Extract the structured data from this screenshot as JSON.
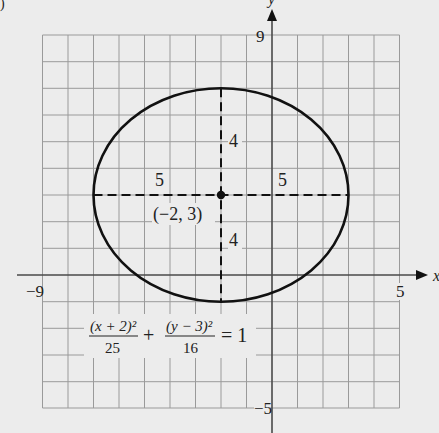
{
  "figure": {
    "corner_fragment": ")",
    "axes": {
      "x_label": "x",
      "y_label": "y",
      "x_min_label": "−9",
      "x_max_label": "5",
      "y_max_label": "9",
      "y_min_label": "−5",
      "x_range": [
        -9,
        5
      ],
      "y_range": [
        -5,
        9
      ]
    },
    "ellipse": {
      "center_label": "(−2, 3)",
      "center": [
        -2,
        3
      ],
      "semi_major": 5,
      "semi_minor": 4,
      "left_radius_label": "5",
      "right_radius_label": "5",
      "top_radius_label": "4",
      "bottom_radius_label": "4"
    },
    "equation": {
      "term1_num": "(x + 2)²",
      "term1_den": "25",
      "plus": "+",
      "term2_num": "(y − 3)²",
      "term2_den": "16",
      "equals": "= 1"
    },
    "colors": {
      "background": "#ececec",
      "grid": "#9a9a9a",
      "axis": "#4a4a4a",
      "curve": "#111111"
    }
  }
}
